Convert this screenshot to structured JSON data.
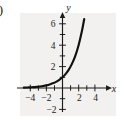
{
  "figure": {
    "label": "a)",
    "panel_bg": "#f2f1ef",
    "ink_color": "#111111"
  },
  "chart_data": {
    "type": "line",
    "title": "",
    "subtitle": "",
    "xlabel": "x",
    "ylabel": "y",
    "xlim": [
      -4.9,
      5.0
    ],
    "ylim": [
      -2.6,
      7.0
    ],
    "grid": false,
    "legend": null,
    "annotations": [],
    "x_ticks": [
      -4,
      -3,
      -2,
      -1,
      1,
      2,
      3,
      4
    ],
    "x_tick_labels": [
      "-4",
      "",
      "-2",
      "",
      "",
      "2",
      "",
      "4"
    ],
    "y_ticks": [
      -2,
      -1,
      1,
      2,
      3,
      4,
      5,
      6
    ],
    "y_tick_labels": [
      "-2",
      "",
      "",
      "2",
      "",
      "4",
      "",
      "6"
    ],
    "series": [
      {
        "name": "exponential curve",
        "description": "increasing exponential growth curve approaching y = 0 asymptotically on the left",
        "x": [
          -4.8,
          -4.4,
          -4.0,
          -3.6,
          -3.2,
          -2.8,
          -2.4,
          -2.0,
          -1.6,
          -1.2,
          -0.8,
          -0.4,
          0.0,
          0.4,
          0.8,
          1.2,
          1.6,
          2.0,
          2.4,
          2.7
        ],
        "y": [
          0.036,
          0.047,
          0.063,
          0.082,
          0.109,
          0.143,
          0.189,
          0.25,
          0.33,
          0.435,
          0.574,
          0.758,
          1.0,
          1.32,
          1.74,
          2.3,
          3.03,
          4.0,
          5.28,
          6.45
        ]
      }
    ],
    "axis_labels": {
      "x": "x",
      "y": "y"
    }
  },
  "tick_text": {
    "x_neg4": "−4",
    "x_neg2": "−2",
    "x_pos2": "2",
    "x_pos4": "4",
    "y_pos2": "2",
    "y_pos4": "4",
    "y_pos6": "6",
    "y_neg2": "−2"
  }
}
